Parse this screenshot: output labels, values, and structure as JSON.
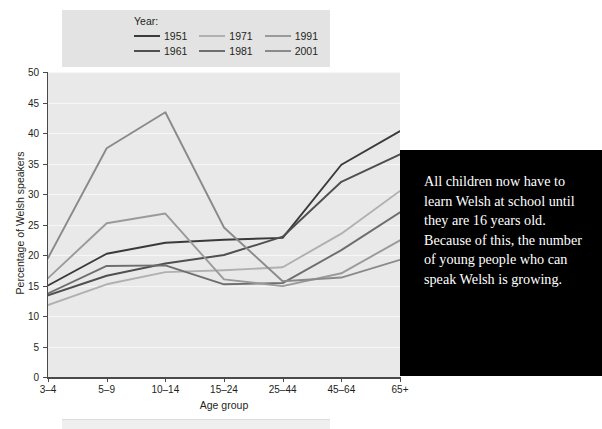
{
  "legend": {
    "title": "Year:",
    "entries": [
      {
        "label": "1951",
        "color": "#3a3a3a"
      },
      {
        "label": "1971",
        "color": "#b0b0b0"
      },
      {
        "label": "1991",
        "color": "#9a9a9a"
      },
      {
        "label": "1961",
        "color": "#4f4f4f"
      },
      {
        "label": "1981",
        "color": "#6e6e6e"
      },
      {
        "label": "2001",
        "color": "#8a8a8a"
      }
    ]
  },
  "callout": {
    "text": "All children now have to learn Welsh at school until they are 16 years old. Because of this, the number of young people who can speak Welsh is growing."
  },
  "chart_data": {
    "type": "line",
    "title": "",
    "xlabel": "Age group",
    "ylabel": "Percentage of Welsh speakers",
    "categories": [
      "3–4",
      "5–9",
      "10–14",
      "15–24",
      "25–44",
      "45–64",
      "65+"
    ],
    "ylim": [
      0,
      50
    ],
    "yticks": [
      0,
      5,
      10,
      15,
      20,
      25,
      30,
      35,
      40,
      45,
      50
    ],
    "grid": true,
    "legend_position": "top-left-outside",
    "plot_background": "#e9e9e9",
    "series": [
      {
        "name": "1951",
        "color": "#3a3a3a",
        "values": [
          15.0,
          20.2,
          22.0,
          22.5,
          22.8,
          34.8,
          40.3
        ]
      },
      {
        "name": "1961",
        "color": "#4f4f4f",
        "values": [
          13.4,
          16.6,
          18.6,
          20.0,
          23.0,
          32.0,
          36.5
        ]
      },
      {
        "name": "1971",
        "color": "#b0b0b0",
        "values": [
          11.8,
          15.2,
          17.2,
          17.5,
          18.0,
          23.5,
          30.5
        ]
      },
      {
        "name": "1981",
        "color": "#6e6e6e",
        "values": [
          13.7,
          18.2,
          18.3,
          15.2,
          15.4,
          20.8,
          27.0
        ]
      },
      {
        "name": "1991",
        "color": "#9a9a9a",
        "values": [
          16.2,
          25.2,
          26.8,
          16.0,
          14.9,
          17.0,
          22.4
        ]
      },
      {
        "name": "2001",
        "color": "#8a8a8a",
        "values": [
          19.5,
          37.5,
          43.4,
          24.5,
          15.7,
          16.3,
          19.2
        ]
      }
    ]
  }
}
